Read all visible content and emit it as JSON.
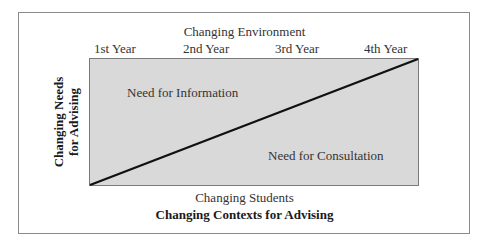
{
  "diagram": {
    "title": "Changing Contexts for Advising",
    "top_axis_label": "Changing Environment",
    "bottom_axis_label": "Changing Students",
    "left_axis_label_line1": "Changing Needs",
    "left_axis_label_line2": "for Advising",
    "years": [
      "1st Year",
      "2nd Year",
      "3rd Year",
      "4th Year"
    ],
    "regions": {
      "upper": "Need for Information",
      "lower": "Need for Consultation"
    },
    "colors": {
      "box_fill": "#d9d9d9",
      "diagonal": "#111111"
    }
  }
}
